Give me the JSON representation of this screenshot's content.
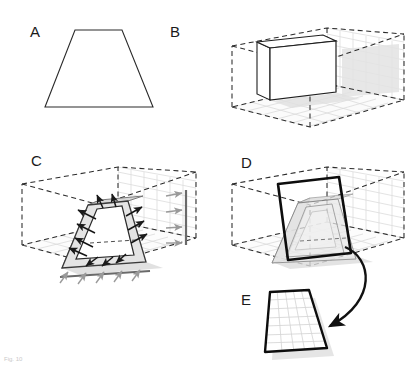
{
  "figure": {
    "caption_fragment": "Fig. 10",
    "panels": [
      {
        "id": "A",
        "label": "A",
        "title": "2D trapezoid outline",
        "x": 30,
        "y": 37
      },
      {
        "id": "B",
        "label": "B",
        "title": "3D box inside dashed room with grid walls",
        "x": 170,
        "y": 37
      },
      {
        "id": "C",
        "label": "C",
        "title": "Frustum with outward normal arrows",
        "x": 31,
        "y": 166
      },
      {
        "id": "D",
        "label": "D",
        "title": "Tilted cutting plane through frustum",
        "x": 241,
        "y": 168
      },
      {
        "id": "E",
        "label": "E",
        "title": "Extracted cutting plane with grid",
        "x": 241,
        "y": 305
      }
    ]
  },
  "colors": {
    "stroke_dark": "#1a1a1a",
    "stroke_mid": "#555555",
    "grid_light": "#d8d8d8",
    "grid_wall": "#dcdcdc",
    "dashed_room": "#2b2b2b",
    "face_light": "#e6e6e6",
    "face_mid": "#cfcfcf",
    "face_dark": "#b4b4b4",
    "shadow": "#d5d5d5",
    "arrow_gray": "#9a9a9a",
    "background": "#ffffff"
  },
  "geometry": {
    "panel_a": {
      "shape": "trapezoid",
      "points": "75,30 122,30 153,107 45,107"
    },
    "panel_b": {
      "room_floor": "232,107 310,127 404,100 327,84",
      "box_front": "270,48 336,41 336,92 270,100",
      "box_top": "257,42 323,35 336,41 270,48",
      "box_side": "257,42 270,48 270,100 257,94",
      "wall_shadow": "342,49 399,44 399,92 342,97"
    },
    "panel_c": {
      "frustum_front": "88,205 128,201 146,262 62,268",
      "frustum_top": "88,205 128,201 143,196 100,200",
      "inner_trapezoid": "97,207 124,204 136,257 75,262",
      "normal_arrow_count": 12,
      "floor_arrow_count": 5,
      "wall_arrow_count": 4
    },
    "panel_d": {
      "cutting_plane": "278,184 339,177 351,253 288,260",
      "curved_arrow_from": "340,248",
      "curved_arrow_to": "314,322"
    },
    "panel_e": {
      "plane": "270,292 309,290 327,348 265,352",
      "grid_rows": 7,
      "grid_cols": 5
    }
  }
}
